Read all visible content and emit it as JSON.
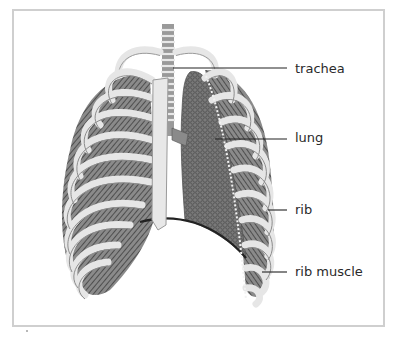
{
  "figure": {
    "frame_color": "#cfcfcf",
    "colors": {
      "bone": "#e6e6e6",
      "bone_outline": "#9a9a9a",
      "muscle": "#5a5a5a",
      "lung": "#6e6e6e",
      "label_line": "#222222",
      "text": "#2a2a2a"
    }
  },
  "labels": [
    {
      "id": "trachea",
      "text": "trachea"
    },
    {
      "id": "lung",
      "text": "lung"
    },
    {
      "id": "rib",
      "text": "rib"
    },
    {
      "id": "rib-muscle",
      "text": "rib muscle"
    }
  ]
}
